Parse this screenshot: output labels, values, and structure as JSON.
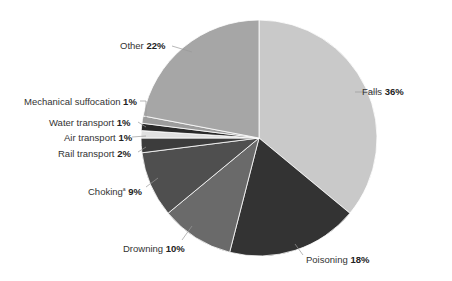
{
  "chart_data": {
    "type": "pie",
    "title": "",
    "start_angle_deg": 0,
    "direction": "clockwise",
    "center": [
      259,
      138
    ],
    "radius": 118,
    "slices": [
      {
        "label": "Falls",
        "value": 36,
        "value_label": "36%",
        "color": "#c9c9c9",
        "label_pos": [
          384,
          86
        ],
        "leader": [
          [
            355,
            92
          ],
          [
            378,
            92
          ]
        ]
      },
      {
        "label": "Poisoning",
        "value": 18,
        "value_label": "18%",
        "color": "#333333",
        "label_pos": [
          306,
          252
        ],
        "leader": [
          [
            295,
            244
          ],
          [
            303,
            255
          ]
        ]
      },
      {
        "label": "Drowning",
        "value": 10,
        "value_label": "10%",
        "color": "#6a6a6a",
        "label_pos": [
          123,
          243
        ],
        "leader": [
          [
            192,
            226
          ],
          [
            182,
            240
          ]
        ]
      },
      {
        "label": "Choking",
        "sup": "a",
        "value": 9,
        "value_label": "9%",
        "color": "#4f4f4f",
        "label_pos": [
          88,
          183
        ],
        "leader": [
          [
            158,
            178
          ],
          [
            146,
            187
          ]
        ]
      },
      {
        "label": "Rail transport",
        "value": 2,
        "value_label": "2%",
        "color": "#3c3c3c",
        "label_pos": [
          58,
          148
        ],
        "leader": [
          [
            146,
            147
          ],
          [
            138,
            152
          ]
        ]
      },
      {
        "label": "Air transport",
        "value": 1,
        "value_label": "1%",
        "color": "#e0e0e0",
        "label_pos": [
          64,
          133
        ],
        "leader": [
          [
            146,
            136
          ],
          [
            132,
            137
          ]
        ]
      },
      {
        "label": "Water transport",
        "value": 1,
        "value_label": "1%",
        "color": "#2a2a2a",
        "label_pos": [
          49,
          118
        ],
        "leader": [
          [
            146,
            127
          ],
          [
            138,
            122
          ]
        ]
      },
      {
        "label": "Mechanical suffocation",
        "value": 1,
        "value_label": "1%",
        "color": "#9c9c9c",
        "label_pos": [
          24,
          97
        ],
        "leader": [
          [
            146,
            118
          ],
          [
            146,
            101
          ],
          [
            140,
            101
          ]
        ]
      },
      {
        "label": "Other",
        "value": 22,
        "value_label": "22%",
        "color": "#a6a6a6",
        "label_pos": [
          120,
          40
        ],
        "leader": [
          [
            192,
            52
          ],
          [
            172,
            46
          ]
        ]
      }
    ],
    "legend": "none (direct labels with leader lines)",
    "slice_border_color": "#ffffff"
  },
  "labels": {
    "falls": {
      "name": "Falls",
      "pct": "36%"
    },
    "poisoning": {
      "name": "Poisoning",
      "pct": "18%"
    },
    "drowning": {
      "name": "Drowning",
      "pct": "10%"
    },
    "choking": {
      "name": "Choking",
      "sup": "a",
      "pct": "9%"
    },
    "rail": {
      "name": "Rail transport",
      "pct": "2%"
    },
    "air": {
      "name": "Air transport",
      "pct": "1%"
    },
    "water": {
      "name": "Water transport",
      "pct": "1%"
    },
    "mech": {
      "name": "Mechanical suffocation",
      "pct": "1%"
    },
    "other": {
      "name": "Other",
      "pct": "22%"
    }
  }
}
